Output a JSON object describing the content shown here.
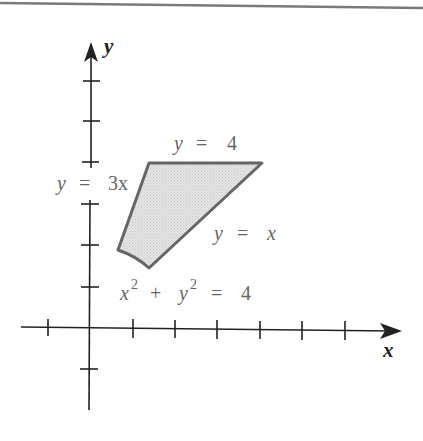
{
  "figure": {
    "axes": {
      "x_label": "x",
      "y_label": "y",
      "x_ticks": [
        -1,
        1,
        2,
        3,
        4,
        5,
        6
      ],
      "y_ticks": [
        -1,
        1,
        2,
        3,
        4,
        5,
        6
      ],
      "unit_px": 42.3,
      "origin_px": [
        89,
        328
      ]
    },
    "curves": {
      "line_y3x": {
        "label_lhs": "y",
        "label_eq": "=",
        "label_rhs": "3x"
      },
      "line_y4": {
        "label_lhs": "y",
        "label_eq": "=",
        "label_rhs": "4"
      },
      "line_yx": {
        "label_lhs": "y",
        "label_eq": "=",
        "label_rhs": "x"
      },
      "circle": {
        "label_x": "x",
        "label_sup1": "2",
        "label_plus": "+",
        "label_y": "y",
        "label_sup2": "2",
        "label_eq": "=",
        "label_rhs": "4"
      }
    },
    "region": {
      "vertices": [
        [
          0.632,
          1.897
        ],
        [
          1.333,
          4
        ],
        [
          4,
          4
        ],
        [
          1.414,
          1.414
        ]
      ],
      "fill_color": "#dedede",
      "stroke_color": "#666666"
    },
    "colors": {
      "axis": "#222222",
      "label": "#666666",
      "top_rule": "#7a7a7a"
    }
  }
}
